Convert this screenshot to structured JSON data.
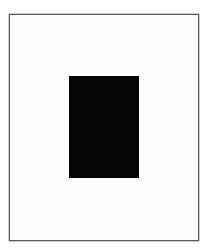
{
  "figure": {
    "frame_color": "#5a5a5a",
    "block_color": "#050505",
    "background_color": "#ffffff"
  }
}
